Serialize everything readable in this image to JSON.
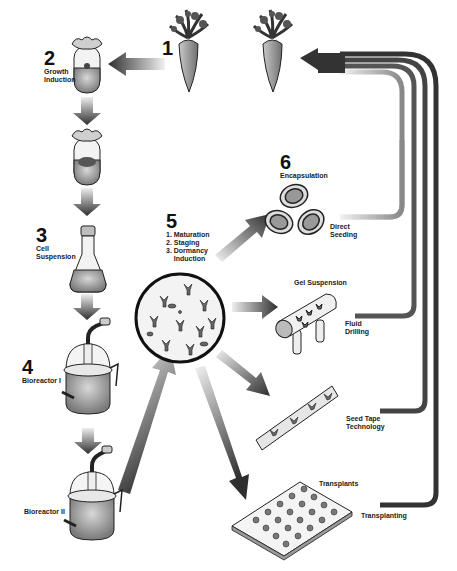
{
  "diagram": {
    "title_cropped": "",
    "steps": [
      {
        "number": "1",
        "label": ""
      },
      {
        "number": "2",
        "label": "Growth\nInduction"
      },
      {
        "number": "3",
        "label": "Cell\nSuspension"
      },
      {
        "number": "4",
        "label": "Bioreactor I"
      },
      {
        "number": "",
        "label": "Bioreactor II"
      },
      {
        "number": "5",
        "label": "",
        "substeps": [
          "1. Maturation",
          "2. Staging",
          "3. Dormancy",
          "    Induction"
        ]
      },
      {
        "number": "6",
        "label": "Encapsulation"
      }
    ],
    "delivery_methods": {
      "direct_seeding": "Direct\nSeeding",
      "gel_suspension": "Gel Suspension",
      "fluid_drilling": "Fluid\nDrilling",
      "seed_tape": "Seed Tape\nTechnology",
      "transplants": "Transplants",
      "transplanting": "Transplanting"
    },
    "icons": [
      "carrot-icon",
      "test-tube-icon",
      "flask-icon",
      "bioreactor-icon",
      "embryo-culture-icon",
      "capsule-icon",
      "gel-cylinder-icon",
      "seed-tape-icon",
      "transplant-tray-icon"
    ],
    "colors": {
      "arrow_dark": "#333333",
      "arrow_light": "#e6e6e6",
      "outline": "#111111",
      "fill_gray": "#9a9a9a"
    }
  }
}
